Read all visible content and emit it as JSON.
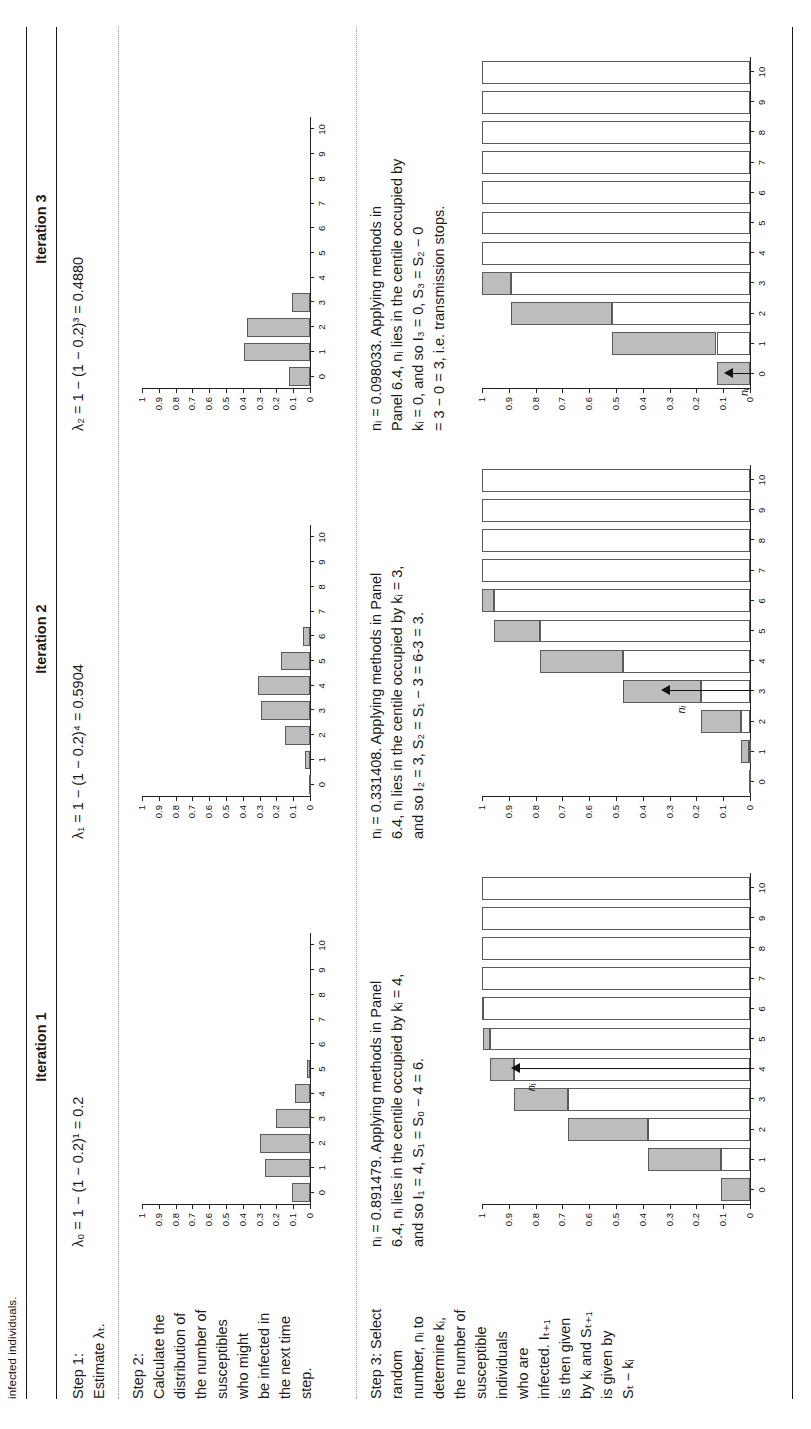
{
  "caption": "infected individuals.",
  "table": {
    "row_labels": [
      "Step 1:\nEstimate λₜ.",
      "Step 2:\nCalculate the\ndistribution of\nthe number of\nsusceptibles\nwho might\nbe infected in\nthe next time\nstep.",
      "Step 3: Select\nrandom\nnumber, nᵢ to\ndetermine kᵢ,\nthe number of\nsusceptible\nindividuals\nwho are\ninfected. Iₜ₊₁\nis then given\nby kᵢ and Sₜ₊₁\nis given by\nSₜ − kᵢ"
    ],
    "row_label_lines": {
      "step1": [
        "Step 1:",
        "Estimate λₜ."
      ],
      "step2": [
        "Step 2:",
        "Calculate the",
        "distribution of",
        "the number of",
        "susceptibles",
        "who might",
        "be infected in",
        "the next time",
        "step."
      ],
      "step3": [
        "Step 3: Select",
        "random",
        "number, nᵢ to",
        "determine kᵢ,",
        "the number of",
        "susceptible",
        "individuals",
        "who are",
        "infected. Iₜ₊₁",
        "is then given",
        "by kᵢ and Sₜ₊₁",
        "is given by",
        "Sₜ − kᵢ"
      ]
    },
    "headers": [
      "Iteration 1",
      "Iteration 2",
      "Iteration 3"
    ],
    "step1": [
      "λ₀ = 1 − (1 − 0.2)¹ = 0.2",
      "λ₁ = 1 − (1 − 0.2)⁴ = 0.5904",
      "λ₂ = 1 − (1 − 0.2)³ = 0.4880"
    ],
    "step3_text": [
      "nᵢ = 0.891479. Applying methods in Panel 6.4, nᵢ lies in the centile occupied by kᵢ = 4, and so I₁ = 4, S₁ = S₀ − 4 = 6.",
      "nᵢ = 0.331408. Applying methods in Panel 6.4, nᵢ lies in the centile occupied by kᵢ = 3, and so I₂ = 3, S₂ = S₁ − 3 = 6-3 = 3.",
      "nᵢ = 0.098033. Applying methods in Panel 6.4, nᵢ lies in the centile occupied by kᵢ = 0, and so I₃ = 0, S₃ = S₂ − 0 = 3 − 0 = 3, i.e. transmission stops."
    ],
    "step3_text_lines": [
      [
        "nᵢ = 0.891479. Applying methods in Panel",
        "6.4, nᵢ lies in the centile occupied by kᵢ = 4,",
        "and so I₁ = 4, S₁ = S₀ − 4 = 6."
      ],
      [
        "nᵢ = 0.331408. Applying methods in Panel",
        "6.4, nᵢ lies in the centile occupied by kᵢ = 3,",
        "and so I₂ = 3, S₂ = S₁ − 3 = 6-3 = 3."
      ],
      [
        "nᵢ = 0.098033. Applying methods in",
        "Panel 6.4, nᵢ lies in the centile occupied by",
        "kᵢ = 0, and so I₃ = 0, S₃ = S₂ − 0",
        "= 3 − 0 = 3, i.e. transmission stops."
      ]
    ],
    "arrow_label": "nᵢ"
  },
  "chart_data": [
    {
      "id": "step2-iter1",
      "type": "bar",
      "title": "",
      "xlabel": "",
      "ylabel": "",
      "categories": [
        "0",
        "1",
        "2",
        "3",
        "4",
        "5",
        "6",
        "7",
        "8",
        "9",
        "10"
      ],
      "values": [
        0.11,
        0.27,
        0.3,
        0.2,
        0.09,
        0.02,
        0.0,
        0.0,
        0.0,
        0.0,
        0.0
      ],
      "ytick_labels": [
        "0",
        "0.1",
        "0.2",
        "0.3",
        "0.4",
        "0.5",
        "0.6",
        "0.7",
        "0.8",
        "0.9",
        "1"
      ],
      "ylim": [
        0,
        1
      ],
      "grid": false,
      "legend": "none",
      "bar_color": "#bdbdbd"
    },
    {
      "id": "step3-iter1",
      "type": "bar",
      "title": "",
      "xlabel": "",
      "ylabel": "",
      "categories": [
        "0",
        "1",
        "2",
        "3",
        "4",
        "5",
        "6",
        "7",
        "8",
        "9",
        "10"
      ],
      "segment_start": [
        0.0,
        0.11,
        0.38,
        0.68,
        0.88,
        0.97,
        0.995,
        1.0,
        1.0,
        1.0,
        1.0
      ],
      "segment_end": [
        0.11,
        0.38,
        0.68,
        0.88,
        0.97,
        0.995,
        1.0,
        1.0,
        1.0,
        1.0,
        1.0
      ],
      "cumulative": [
        0.11,
        0.38,
        0.68,
        0.88,
        0.97,
        0.995,
        1.0,
        1.0,
        1.0,
        1.0,
        1.0
      ],
      "ytick_labels": [
        "0",
        "0.1",
        "0.2",
        "0.3",
        "0.4",
        "0.5",
        "0.6",
        "0.7",
        "0.8",
        "0.9",
        "1"
      ],
      "ylim": [
        0,
        1
      ],
      "marker": {
        "label": "nᵢ",
        "value": 0.891479,
        "category": "4"
      },
      "grid": false,
      "legend": "none"
    },
    {
      "id": "step2-iter2",
      "type": "bar",
      "title": "",
      "xlabel": "",
      "ylabel": "",
      "categories": [
        "0",
        "1",
        "2",
        "3",
        "4",
        "5",
        "6",
        "7",
        "8",
        "9",
        "10"
      ],
      "values": [
        0.004,
        0.03,
        0.15,
        0.29,
        0.31,
        0.17,
        0.04,
        0.0,
        0.0,
        0.0,
        0.0
      ],
      "ytick_labels": [
        "0",
        "0.1",
        "0.2",
        "0.3",
        "0.4",
        "0.5",
        "0.6",
        "0.7",
        "0.8",
        "0.9",
        "1"
      ],
      "ylim": [
        0,
        1
      ],
      "grid": false,
      "legend": "none",
      "bar_color": "#bdbdbd"
    },
    {
      "id": "step3-iter2",
      "type": "bar",
      "title": "",
      "xlabel": "",
      "ylabel": "",
      "categories": [
        "0",
        "1",
        "2",
        "3",
        "4",
        "5",
        "6",
        "7",
        "8",
        "9",
        "10"
      ],
      "segment_start": [
        0.0,
        0.004,
        0.034,
        0.184,
        0.474,
        0.784,
        0.954,
        1.0,
        1.0,
        1.0,
        1.0
      ],
      "segment_end": [
        0.004,
        0.034,
        0.184,
        0.474,
        0.784,
        0.954,
        1.0,
        1.0,
        1.0,
        1.0,
        1.0
      ],
      "cumulative": [
        0.004,
        0.034,
        0.184,
        0.474,
        0.784,
        0.954,
        1.0,
        1.0,
        1.0,
        1.0,
        1.0
      ],
      "ytick_labels": [
        "0",
        "0.1",
        "0.2",
        "0.3",
        "0.4",
        "0.5",
        "0.6",
        "0.7",
        "0.8",
        "0.9",
        "1"
      ],
      "ylim": [
        0,
        1
      ],
      "marker": {
        "label": "nᵢ",
        "value": 0.331408,
        "category": "3"
      },
      "grid": false,
      "legend": "none"
    },
    {
      "id": "step2-iter3",
      "type": "bar",
      "title": "",
      "xlabel": "",
      "ylabel": "",
      "categories": [
        "0",
        "1",
        "2",
        "3",
        "4",
        "5",
        "6",
        "7",
        "8",
        "9",
        "10"
      ],
      "values": [
        0.125,
        0.39,
        0.375,
        0.11,
        0.0,
        0.0,
        0.0,
        0.0,
        0.0,
        0.0,
        0.0
      ],
      "ytick_labels": [
        "0",
        "0.1",
        "0.2",
        "0.3",
        "0.4",
        "0.5",
        "0.6",
        "0.7",
        "0.8",
        "0.9",
        "1"
      ],
      "ylim": [
        0,
        1
      ],
      "grid": false,
      "legend": "none",
      "bar_color": "#bdbdbd"
    },
    {
      "id": "step3-iter3",
      "type": "bar",
      "title": "",
      "xlabel": "",
      "ylabel": "",
      "categories": [
        "0",
        "1",
        "2",
        "3",
        "4",
        "5",
        "6",
        "7",
        "8",
        "9",
        "10"
      ],
      "segment_start": [
        0.0,
        0.125,
        0.515,
        0.89,
        1.0,
        1.0,
        1.0,
        1.0,
        1.0,
        1.0,
        1.0
      ],
      "segment_end": [
        0.125,
        0.515,
        0.89,
        1.0,
        1.0,
        1.0,
        1.0,
        1.0,
        1.0,
        1.0,
        1.0
      ],
      "cumulative": [
        0.125,
        0.515,
        0.89,
        1.0,
        1.0,
        1.0,
        1.0,
        1.0,
        1.0,
        1.0,
        1.0
      ],
      "ytick_labels": [
        "0",
        "0.1",
        "0.2",
        "0.3",
        "0.4",
        "0.5",
        "0.6",
        "0.7",
        "0.8",
        "0.9",
        "1"
      ],
      "ylim": [
        0,
        1
      ],
      "marker": {
        "label": "nᵢ",
        "value": 0.098033,
        "category": "0"
      },
      "grid": false,
      "legend": "none"
    }
  ]
}
